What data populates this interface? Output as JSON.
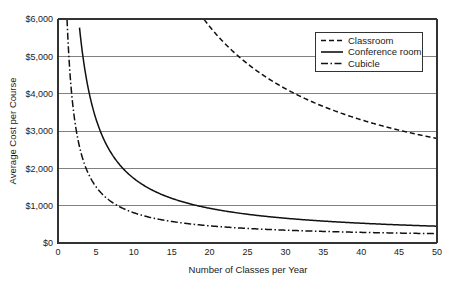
{
  "chart_data": {
    "type": "line",
    "title": "",
    "xlabel": "Number of Classes per Year",
    "ylabel": "Average Cost per Course",
    "xlim": [
      0,
      50
    ],
    "ylim": [
      0,
      6000
    ],
    "xticks": [
      0,
      5,
      10,
      15,
      20,
      25,
      30,
      35,
      40,
      45,
      50
    ],
    "xtick_labels": [
      "0",
      "5",
      "10",
      "15",
      "20",
      "25",
      "30",
      "35",
      "40",
      "45",
      "50"
    ],
    "yticks": [
      0,
      1000,
      2000,
      3000,
      4000,
      5000,
      6000
    ],
    "ytick_labels": [
      "$0",
      "$1,000",
      "$2,000",
      "$3,000",
      "$4,000",
      "$5,000",
      "$6,000"
    ],
    "grid": "horizontal",
    "legend_position": "top-right",
    "series": [
      {
        "name": "Classroom",
        "style": "dashed",
        "dasharray": "5,3",
        "color": "#111111",
        "model": {
          "fixed": 100000,
          "variable": 800
        },
        "x": [
          16.7,
          17,
          18,
          19,
          20,
          21,
          22,
          23,
          24,
          25,
          26,
          27,
          28,
          29,
          30,
          32,
          34,
          36,
          38,
          40,
          41,
          42,
          44,
          46,
          48,
          50
        ],
        "values": [
          6790,
          6682,
          6356,
          6063,
          5800,
          5562,
          5345,
          5148,
          4967,
          4800,
          4646,
          4504,
          4371,
          4248,
          4133,
          3925,
          3741,
          3578,
          3432,
          3300,
          3239,
          3181,
          3073,
          2974,
          2883,
          2800
        ]
      },
      {
        "name": "Conference room",
        "style": "solid",
        "dasharray": "",
        "color": "#111111",
        "model": {
          "fixed": 16000,
          "variable": 130
        },
        "x": [
          2.72,
          3,
          4,
          5,
          6,
          7,
          8,
          9,
          10,
          12,
          14,
          16,
          18,
          20,
          22,
          25,
          28,
          30,
          33,
          36,
          40,
          44,
          47,
          50
        ],
        "values": [
          6010,
          5463,
          4130,
          3330,
          2797,
          2416,
          2130,
          1908,
          1730,
          1463,
          1273,
          1130,
          1019,
          930,
          857,
          770,
          701,
          663,
          615,
          574,
          530,
          494,
          470,
          450
        ]
      },
      {
        "name": "Cubicle",
        "style": "dash-dot",
        "dasharray": "7,2.5,1.5,2.5",
        "color": "#111111",
        "model": {
          "fixed": 7000,
          "variable": 110
        },
        "x": [
          1.19,
          1.4,
          1.8,
          2.2,
          2.6,
          3,
          3.5,
          4,
          5,
          6,
          7,
          8,
          9,
          10,
          12,
          14,
          16,
          18,
          20,
          23,
          26,
          30,
          34,
          38,
          42,
          46,
          50
        ],
        "values": [
          6000,
          5110,
          3999,
          3292,
          2802,
          2443,
          2110,
          1860,
          1510,
          1277,
          1110,
          985,
          888,
          810,
          693,
          610,
          548,
          499,
          460,
          414,
          379,
          343,
          316,
          294,
          277,
          262,
          250
        ]
      }
    ]
  },
  "axes": {
    "y_title": "Average Cost per Course",
    "x_title": "Number of Classes per Year"
  },
  "legend": {
    "entries": [
      {
        "label": "Classroom"
      },
      {
        "label": "Conference room"
      },
      {
        "label": "Cubicle"
      }
    ]
  }
}
